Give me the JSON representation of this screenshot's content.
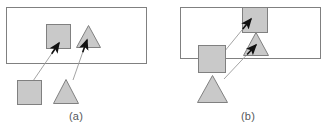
{
  "figure": {
    "width": 329,
    "height": 131,
    "background": "#ffffff",
    "stroke_color": "#808080",
    "shape_fill": "#c9c9c9",
    "arrow_color": "#111111",
    "arrow_line_color": "#9a9a9a",
    "caption_color": "#55585c"
  },
  "panels": [
    {
      "id": "a",
      "caption": "(a)",
      "frame": {
        "x": 6,
        "y": 7,
        "width": 140,
        "height": 56
      },
      "shapes": [
        {
          "name": "square-inside-frame",
          "type": "square",
          "x": 46,
          "y": 24,
          "size": 24
        },
        {
          "name": "triangle-inside-frame",
          "type": "triangle",
          "x": 76,
          "y": 25,
          "width": 25,
          "height": 23
        },
        {
          "name": "square-outside-frame",
          "type": "square",
          "x": 17,
          "y": 80,
          "size": 24
        },
        {
          "name": "triangle-outside-frame",
          "type": "triangle",
          "x": 53,
          "y": 79,
          "width": 26,
          "height": 25
        }
      ],
      "arrows": [
        {
          "name": "arrow-square-to-square",
          "x1": 33,
          "y1": 81,
          "x2": 59,
          "y2": 43
        },
        {
          "name": "arrow-triangle-to-triangle",
          "x1": 73,
          "y1": 80,
          "x2": 87,
          "y2": 40
        }
      ]
    },
    {
      "id": "b",
      "caption": "(b)",
      "frame": {
        "x": 180,
        "y": 7,
        "width": 140,
        "height": 51
      },
      "shapes": [
        {
          "name": "square-top-inside-frame",
          "type": "square",
          "x": 242,
          "y": 7,
          "size": 25
        },
        {
          "name": "triangle-inside-frame",
          "type": "triangle",
          "x": 243,
          "y": 32,
          "width": 26,
          "height": 24
        },
        {
          "name": "square-straddling-frame",
          "type": "square",
          "x": 198,
          "y": 45,
          "size": 27
        },
        {
          "name": "triangle-outside-frame",
          "type": "triangle",
          "x": 197,
          "y": 75,
          "width": 31,
          "height": 28
        }
      ],
      "arrows": [
        {
          "name": "arrow-square-to-top-square",
          "x1": 224,
          "y1": 52,
          "x2": 251,
          "y2": 19
        },
        {
          "name": "arrow-triangle-to-triangle",
          "x1": 224,
          "y1": 79,
          "x2": 256,
          "y2": 45
        }
      ]
    }
  ]
}
